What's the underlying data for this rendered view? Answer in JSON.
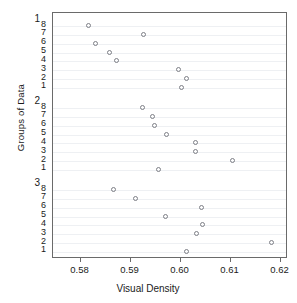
{
  "chart_data": {
    "type": "scatter",
    "title": "",
    "xlabel": "Visual Density",
    "ylabel": "Groups of Data",
    "xlim": [
      0.5745,
      0.6215
    ],
    "xticks": [
      0.58,
      0.59,
      0.6,
      0.61,
      0.62
    ],
    "xticklabels": [
      "0.58",
      "0.59",
      "0.60",
      "0.61",
      "0.62"
    ],
    "grid": true,
    "grid_orientation": "horizontal",
    "legend": "none",
    "marker": "open-circle",
    "marker_color": "#7d7f86",
    "group_labels": [
      "1",
      "2",
      "3"
    ],
    "subtick_labels": [
      "8",
      "7",
      "6",
      "5",
      "4",
      "3",
      "2",
      "1"
    ],
    "series": [
      {
        "name": "1",
        "group": 1,
        "points": [
          {
            "row": 8,
            "x": 0.5817
          },
          {
            "row": 7,
            "x": 0.5927
          },
          {
            "row": 6,
            "x": 0.5831
          },
          {
            "row": 5,
            "x": 0.5859
          },
          {
            "row": 4,
            "x": 0.5872
          },
          {
            "row": 3,
            "x": 0.5997
          },
          {
            "row": 2,
            "x": 0.6012
          },
          {
            "row": 1,
            "x": 0.6003
          }
        ]
      },
      {
        "name": "2",
        "group": 2,
        "points": [
          {
            "row": 8,
            "x": 0.5924
          },
          {
            "row": 7,
            "x": 0.5945
          },
          {
            "row": 6,
            "x": 0.5949
          },
          {
            "row": 5,
            "x": 0.5973
          },
          {
            "row": 4,
            "x": 0.6031
          },
          {
            "row": 3,
            "x": 0.6031
          },
          {
            "row": 2,
            "x": 0.6104
          },
          {
            "row": 1,
            "x": 0.5957
          }
        ]
      },
      {
        "name": "3",
        "group": 3,
        "points": [
          {
            "row": 8,
            "x": 0.5866
          },
          {
            "row": 7,
            "x": 0.5911
          },
          {
            "row": 6,
            "x": 0.6043
          },
          {
            "row": 5,
            "x": 0.5971
          },
          {
            "row": 4,
            "x": 0.6045
          },
          {
            "row": 3,
            "x": 0.6032
          },
          {
            "row": 2,
            "x": 0.6182
          },
          {
            "row": 1,
            "x": 0.6012
          }
        ]
      }
    ]
  }
}
